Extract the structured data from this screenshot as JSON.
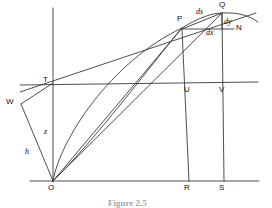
{
  "figure": {
    "kind": "geometry-diagram",
    "caption": "Figure 2.5",
    "points": [
      {
        "id": "O",
        "label": "O",
        "x": 53,
        "y": 181,
        "label_x": 48,
        "label_y": 184
      },
      {
        "id": "T",
        "label": "T",
        "x": 53,
        "y": 83,
        "label_x": 43,
        "label_y": 76
      },
      {
        "id": "W",
        "label": "W",
        "x": 21,
        "y": 104,
        "label_x": 6,
        "label_y": 98
      },
      {
        "id": "P",
        "label": "P",
        "x": 182,
        "y": 28,
        "label_x": 177,
        "label_y": 15
      },
      {
        "id": "Q",
        "label": "Q",
        "x": 222,
        "y": 13,
        "label_x": 219,
        "label_y": 1
      },
      {
        "id": "N",
        "label": "N",
        "x": 240,
        "y": 27,
        "label_x": 236,
        "label_y": 24
      },
      {
        "id": "U",
        "label": "U",
        "x": 189,
        "y": 83,
        "label_x": 184,
        "label_y": 86
      },
      {
        "id": "V",
        "label": "V",
        "x": 224,
        "y": 83,
        "label_x": 219,
        "label_y": 86
      },
      {
        "id": "R",
        "label": "R",
        "x": 189,
        "y": 181,
        "label_x": 184,
        "label_y": 184
      },
      {
        "id": "S",
        "label": "S",
        "x": 224,
        "y": 181,
        "label_x": 219,
        "label_y": 184
      }
    ],
    "measures": [
      {
        "id": "ds",
        "label": "ds",
        "label_x": 196,
        "label_y": 8
      },
      {
        "id": "dy",
        "label": "dy",
        "label_x": 224,
        "label_y": 18
      },
      {
        "id": "dx",
        "label": "dx",
        "label_x": 206,
        "label_y": 29
      },
      {
        "id": "z",
        "label": "z",
        "label_x": 44,
        "label_y": 128
      },
      {
        "id": "h",
        "label": "h",
        "label_x": 25,
        "label_y": 148
      }
    ],
    "colors": {
      "stroke": "#3a3a3a",
      "label": "#0d0d0d",
      "caption": "#5a5a5a"
    }
  }
}
